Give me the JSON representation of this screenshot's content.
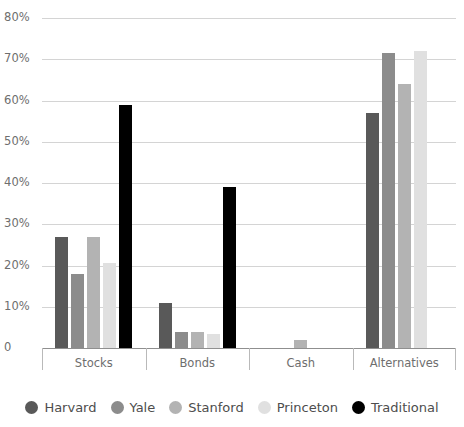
{
  "chart_data": {
    "type": "bar",
    "title": "",
    "subtitle": "",
    "xlabel": "",
    "ylabel": "",
    "categories": [
      "Stocks",
      "Bonds",
      "Cash",
      "Alternatives"
    ],
    "series": [
      {
        "name": "Harvard",
        "color": "#595959",
        "values": [
          27,
          11,
          0,
          57
        ]
      },
      {
        "name": "Yale",
        "color": "#8c8c8c",
        "values": [
          18,
          4,
          0,
          71.5
        ]
      },
      {
        "name": "Stanford",
        "color": "#b3b3b3",
        "values": [
          27,
          4,
          2,
          64
        ]
      },
      {
        "name": "Princeton",
        "color": "#e0e0e0",
        "values": [
          20.5,
          3.5,
          0,
          72
        ]
      },
      {
        "name": "Traditional",
        "color": "#000000",
        "values": [
          59,
          39,
          0,
          0
        ]
      }
    ],
    "ylim": [
      0,
      80
    ],
    "ytick_values": [
      0,
      10,
      20,
      30,
      40,
      50,
      60,
      70,
      80
    ],
    "ytick_labels": [
      "0",
      "10%",
      "20%",
      "30%",
      "40%",
      "50%",
      "60%",
      "70%",
      "80%"
    ],
    "grid": true,
    "legend_position": "bottom",
    "value_unit": "%"
  },
  "colors": {
    "grid": "#d4d4d4",
    "axis": "#8f8f8f",
    "tick_text": "#6e6e6e",
    "legend_text": "#4d4d4d",
    "background": "#ffffff"
  }
}
